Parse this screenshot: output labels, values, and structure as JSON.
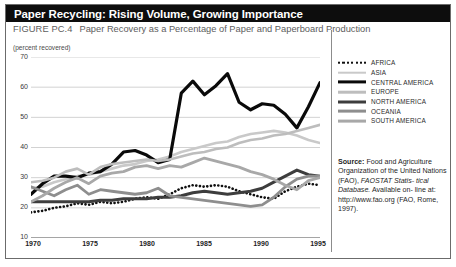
{
  "header": {
    "title": "Paper Recycling: Rising Volume, Growing Importance",
    "title_bg": "#0d0d0d",
    "title_color": "#ffffff"
  },
  "figure": {
    "number_label": "FIGURE PC.4",
    "caption": "Paper Recovery as a Percentage of Paper and Paperboard Production",
    "unit_label": "(percent recovered)"
  },
  "source": {
    "label": "Source:",
    "line1": " Food and Agriculture",
    "line2": "Organization of the United",
    "line3_pre": "Nations (FAO), ",
    "line3_italic": "FAOSTAT Statis-",
    "line4_italic": "tical Database.",
    "line4_post": " Available on-",
    "line5": "line at: http://www.fao.org",
    "line6": "(FAO, Rome, 1997)."
  },
  "legend": {
    "items": [
      {
        "label": "AFRICA",
        "color": "#111111",
        "style": "dotted",
        "width": 2.6
      },
      {
        "label": "ASIA",
        "color": "#c9c9c9",
        "style": "solid",
        "width": 2.6
      },
      {
        "label": "CENTRAL AMERICA",
        "color": "#0a0a0a",
        "style": "solid",
        "width": 3.2
      },
      {
        "label": "EUROPE",
        "color": "#bdbdbd",
        "style": "solid",
        "width": 2.6
      },
      {
        "label": "NORTH AMERICA",
        "color": "#3d3d3d",
        "style": "solid",
        "width": 3.0
      },
      {
        "label": "OCEANIA",
        "color": "#8e8e8e",
        "style": "solid",
        "width": 2.8
      },
      {
        "label": "SOUTH AMERICA",
        "color": "#a8a8a8",
        "style": "solid",
        "width": 2.8
      }
    ]
  },
  "chart_data": {
    "type": "line",
    "title": "Paper Recovery as a Percentage of Paper and Paperboard Production",
    "xlabel": "",
    "ylabel": "(percent recovered)",
    "xlim": [
      1970,
      1995
    ],
    "ylim": [
      10,
      70
    ],
    "yticks": [
      10,
      20,
      30,
      40,
      50,
      60,
      70
    ],
    "xticks": [
      1970,
      1975,
      1980,
      1985,
      1990,
      1995
    ],
    "grid": "horizontal",
    "legend_position": "right",
    "x": [
      1970,
      1971,
      1972,
      1973,
      1974,
      1975,
      1976,
      1977,
      1978,
      1979,
      1980,
      1981,
      1982,
      1983,
      1984,
      1985,
      1986,
      1987,
      1988,
      1989,
      1990,
      1991,
      1992,
      1993,
      1994,
      1995
    ],
    "series": [
      {
        "name": "AFRICA",
        "color": "#111111",
        "style": "dotted",
        "width": 2.6,
        "values": [
          18.5,
          19.0,
          20.0,
          20.5,
          21.5,
          21.0,
          22.0,
          21.5,
          22.0,
          23.0,
          23.5,
          23.0,
          24.5,
          26.5,
          27.5,
          27.0,
          27.5,
          27.0,
          25.5,
          24.5,
          23.5,
          23.0,
          25.5,
          27.0,
          28.0,
          27.5
        ]
      },
      {
        "name": "ASIA",
        "color": "#c9c9c9",
        "style": "solid",
        "width": 2.6,
        "values": [
          26.5,
          27.0,
          28.5,
          29.5,
          30.5,
          31.0,
          32.0,
          33.0,
          34.0,
          34.5,
          35.5,
          36.0,
          37.0,
          38.5,
          39.5,
          40.5,
          41.5,
          42.0,
          43.5,
          44.5,
          45.0,
          45.5,
          45.0,
          44.0,
          42.5,
          41.5
        ]
      },
      {
        "name": "CENTRAL AMERICA",
        "color": "#0a0a0a",
        "style": "solid",
        "width": 3.2,
        "values": [
          24.5,
          28.0,
          30.5,
          30.5,
          30.0,
          31.5,
          32.0,
          34.5,
          38.5,
          39.0,
          37.5,
          35.0,
          36.0,
          58.0,
          62.0,
          57.5,
          60.5,
          64.5,
          55.0,
          52.5,
          54.5,
          54.0,
          51.0,
          46.5,
          53.5,
          61.5
        ]
      },
      {
        "name": "EUROPE",
        "color": "#bdbdbd",
        "style": "solid",
        "width": 2.6,
        "values": [
          28.5,
          29.0,
          30.0,
          32.0,
          33.0,
          31.0,
          33.5,
          34.5,
          35.0,
          35.5,
          36.0,
          35.5,
          36.0,
          37.0,
          38.0,
          38.5,
          39.5,
          40.0,
          41.5,
          42.5,
          43.0,
          44.0,
          44.5,
          45.5,
          46.5,
          47.5
        ]
      },
      {
        "name": "NORTH AMERICA",
        "color": "#3d3d3d",
        "style": "solid",
        "width": 3.0,
        "values": [
          22.0,
          22.0,
          22.0,
          22.0,
          22.0,
          22.0,
          22.5,
          22.5,
          23.0,
          23.0,
          23.0,
          23.5,
          23.5,
          24.0,
          25.0,
          25.5,
          25.0,
          24.5,
          25.0,
          25.5,
          26.5,
          28.5,
          30.5,
          32.5,
          31.0,
          30.5
        ]
      },
      {
        "name": "OCEANIA",
        "color": "#8e8e8e",
        "style": "solid",
        "width": 2.8,
        "values": [
          27.0,
          25.5,
          24.0,
          26.0,
          27.5,
          24.5,
          26.0,
          25.5,
          25.0,
          24.5,
          25.0,
          26.5,
          24.0,
          23.5,
          23.0,
          22.5,
          22.0,
          21.5,
          21.0,
          20.5,
          21.0,
          23.5,
          27.0,
          29.5,
          30.5,
          30.5
        ]
      },
      {
        "name": "SOUTH AMERICA",
        "color": "#a8a8a8",
        "style": "solid",
        "width": 2.8,
        "values": [
          22.0,
          24.0,
          26.5,
          28.5,
          30.0,
          28.0,
          30.5,
          31.5,
          32.0,
          33.5,
          34.0,
          33.0,
          34.0,
          33.5,
          35.0,
          36.5,
          35.5,
          34.5,
          33.5,
          32.0,
          31.0,
          29.5,
          27.5,
          26.0,
          29.0,
          30.0
        ]
      }
    ]
  }
}
